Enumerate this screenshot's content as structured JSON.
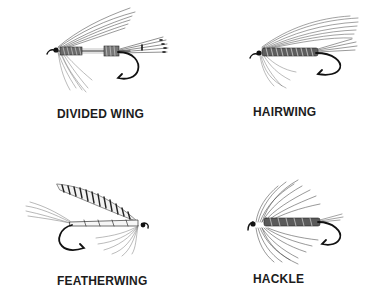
{
  "figure": {
    "background_color": "#ffffff",
    "ink_color": "#1c1c1c",
    "flies": [
      {
        "id": "divided-wing",
        "label": "DIVIDED WING"
      },
      {
        "id": "hairwing",
        "label": "HAIRWING"
      },
      {
        "id": "featherwing",
        "label": "FEATHERWING"
      },
      {
        "id": "hackle",
        "label": "HACKLE"
      }
    ]
  }
}
